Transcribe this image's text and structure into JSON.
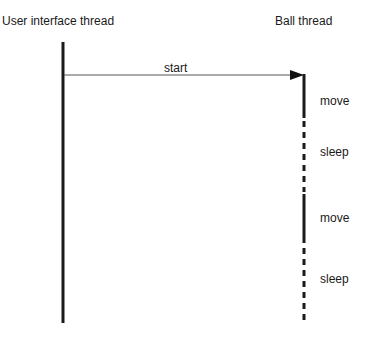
{
  "diagram": {
    "type": "sequence",
    "lanes": [
      {
        "id": "ui",
        "title": "User interface thread"
      },
      {
        "id": "ball",
        "title": "Ball thread"
      }
    ],
    "message": {
      "from": "ui",
      "to": "ball",
      "label": "start"
    },
    "ball_activities": [
      {
        "label": "move",
        "style": "solid"
      },
      {
        "label": "sleep",
        "style": "dashed"
      },
      {
        "label": "move",
        "style": "solid"
      },
      {
        "label": "sleep",
        "style": "dashed"
      }
    ]
  }
}
